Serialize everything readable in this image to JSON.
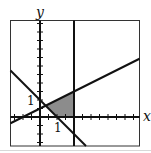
{
  "figure": {
    "type": "inequality-system-graph",
    "axis_labels": {
      "x": "x",
      "y": "y"
    },
    "tick_labels": {
      "x_unit": "1",
      "y_unit": "1"
    },
    "tick_spacing": 0.5,
    "window": {
      "xmin": -1.75,
      "xmax": 5.8,
      "ymin": -1.7,
      "ymax": 5.7
    },
    "lines": [
      {
        "name": "descending-line",
        "equation": "x + y = 1",
        "slope": -1,
        "intercept": 1
      },
      {
        "name": "ascending-line",
        "equation": "y = x/2 + 1/2",
        "slope": 0.5,
        "intercept": 0.5
      },
      {
        "name": "vertical-line",
        "equation": "x = 2",
        "x": 2
      }
    ],
    "feasible_region": {
      "vertices": [
        [
          0.3333,
          0.6667
        ],
        [
          1,
          0
        ],
        [
          2,
          0
        ],
        [
          2,
          1.5
        ]
      ],
      "fill": "#8c8c8c"
    },
    "colors": {
      "line": "#111111",
      "frame": "#333333",
      "background": "#ffffff"
    }
  }
}
